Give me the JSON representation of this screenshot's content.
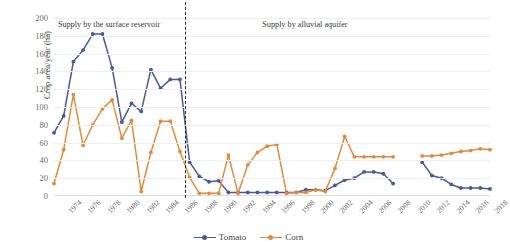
{
  "chart_data": {
    "type": "line",
    "title": "",
    "xlabel": "",
    "ylabel": "Crop area/year (ha)",
    "ylim": [
      0,
      200
    ],
    "ytick_step": 20,
    "yticks": [
      200,
      180,
      160,
      140,
      120,
      100,
      80,
      60,
      40,
      20,
      0
    ],
    "xlim": [
      1974,
      2019
    ],
    "xticks": [
      1974,
      1976,
      1978,
      1980,
      1982,
      1984,
      1986,
      1988,
      1990,
      1992,
      1994,
      1996,
      1998,
      2000,
      2002,
      2004,
      2006,
      2008,
      2010,
      2012,
      2014,
      2016,
      2018
    ],
    "grid": true,
    "legend_position": "bottom-center",
    "x": [
      1974,
      1975,
      1976,
      1977,
      1978,
      1979,
      1980,
      1981,
      1982,
      1983,
      1984,
      1985,
      1986,
      1987,
      1988,
      1989,
      1990,
      1991,
      1992,
      1993,
      1994,
      1995,
      1996,
      1997,
      1998,
      1999,
      2000,
      2001,
      2002,
      2003,
      2004,
      2005,
      2006,
      2007,
      2008,
      2009,
      2010,
      2011,
      2012,
      2013,
      2014,
      2015,
      2016,
      2017,
      2018,
      2019
    ],
    "series": [
      {
        "name": "Tomato",
        "color": "#4a5896",
        "values": [
          71,
          90,
          151,
          164,
          182,
          182,
          144,
          83,
          104,
          95,
          142,
          121,
          131,
          131,
          38,
          22,
          16,
          17,
          4,
          4,
          4,
          4,
          4,
          4,
          4,
          4,
          7,
          7,
          6,
          12,
          18,
          20,
          27,
          27,
          25,
          14,
          null,
          null,
          38,
          23,
          20,
          13,
          9,
          9,
          9,
          8
        ]
      },
      {
        "name": "Corn",
        "color": "#e08b3c",
        "values": [
          14,
          52,
          114,
          57,
          80,
          98,
          108,
          65,
          85,
          5,
          49,
          84,
          84,
          50,
          21,
          3,
          3,
          3,
          46,
          3,
          35,
          49,
          56,
          58,
          3,
          4,
          4,
          7,
          5,
          31,
          67,
          44,
          44,
          44,
          44,
          44,
          null,
          null,
          45,
          45,
          46,
          48,
          50,
          51,
          53,
          52
        ]
      }
    ],
    "annotations": [
      {
        "name": "surface-reservoir-band",
        "text": "Supply by the surface reservoir",
        "x": 1974.4,
        "y": 192
      },
      {
        "name": "alluvial-aquifer-band",
        "text": "Supply by alluvial aquifer",
        "x": 1995.5,
        "y": 192
      }
    ],
    "divider": {
      "x": 1987.5,
      "style": "dash-dot",
      "color": "#2b2b2b"
    }
  },
  "legend": {
    "items": [
      {
        "label": "Tomato",
        "color": "#4a5896"
      },
      {
        "label": "Corn",
        "color": "#e08b3c"
      }
    ]
  }
}
